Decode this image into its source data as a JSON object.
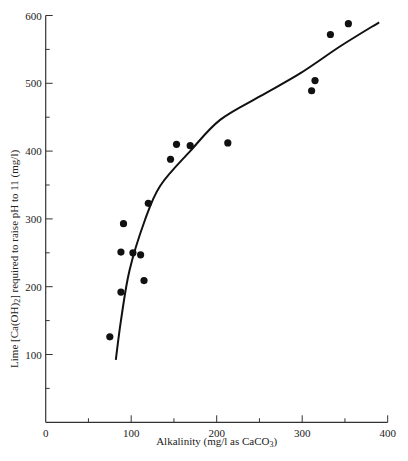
{
  "chart_data": {
    "type": "scatter",
    "title": "",
    "xlabel": "Alkalinity (mg/l as CaCO3)",
    "xlabel_main": "Alkalinity (mg/l as CaCO",
    "xlabel_sub": "3",
    "xlabel_end": ")",
    "ylabel": "Lime [Ca(OH)2] required to raise pH to 11 (mg/l)",
    "ylabel_pre": "Lime [Ca(OH)",
    "ylabel_sub": "2",
    "ylabel_post": "] required to raise pH to 11 (mg/l)",
    "xlim": [
      0,
      400
    ],
    "ylim": [
      0,
      600
    ],
    "x_ticks": [
      0,
      100,
      200,
      300,
      400
    ],
    "y_ticks": [
      100,
      200,
      300,
      400,
      500,
      600
    ],
    "x_tick_labels": [
      "0",
      "100",
      "200",
      "300",
      "400"
    ],
    "y_tick_labels": [
      "100",
      "200",
      "300",
      "400",
      "500",
      "600"
    ],
    "grid": false,
    "legend": null,
    "series": [
      {
        "name": "Observed data",
        "type": "scatter",
        "x": [
          75,
          88,
          88,
          91,
          102,
          111,
          115,
          120,
          146,
          153,
          169,
          213,
          311,
          315,
          333,
          354
        ],
        "y": [
          126,
          192,
          251,
          293,
          250,
          247,
          209,
          323,
          388,
          410,
          408,
          412,
          489,
          504,
          572,
          588
        ]
      },
      {
        "name": "Fitted curve",
        "type": "line",
        "x": [
          82,
          88,
          98,
          116,
          134,
          169,
          204,
          251,
          298,
          345,
          390
        ],
        "y": [
          92,
          150,
          224,
          298,
          349,
          400,
          446,
          481,
          515,
          555,
          590
        ]
      }
    ]
  }
}
